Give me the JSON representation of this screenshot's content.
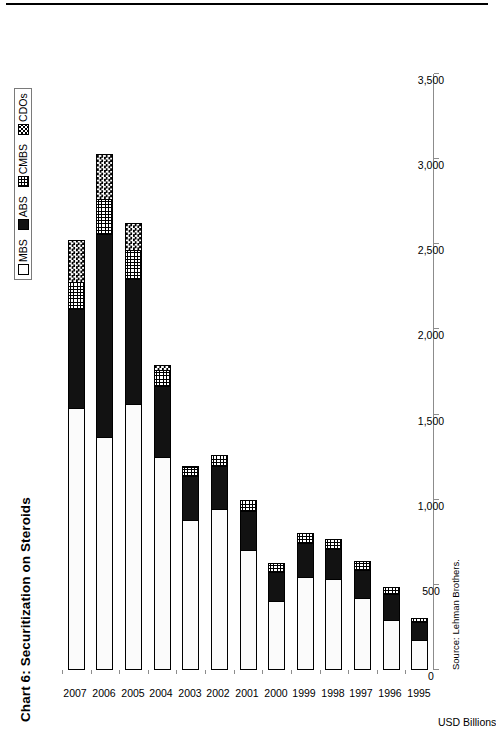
{
  "chart_data": {
    "type": "bar",
    "orientation": "horizontal-stacked",
    "title": "Chart 6: Securitization on Steroids",
    "xlabel": "USD Billions",
    "ylabel": "",
    "source": "Source: Lehman Brothers.",
    "grid": false,
    "legend_position": "top-right",
    "value_axis_label": "USD Billions",
    "value_ticks": [
      "0",
      "500",
      "1,000",
      "1,500",
      "2,000",
      "2,500",
      "3,000",
      "3,500"
    ],
    "value_tick_numbers": [
      0,
      500,
      1000,
      1500,
      2000,
      2500,
      3000,
      3500
    ],
    "xlim": [
      0,
      3500
    ],
    "categories": [
      "1995",
      "1996",
      "1997",
      "1998",
      "1999",
      "2000",
      "2001",
      "2002",
      "2003",
      "2004",
      "2005",
      "2006",
      "2007"
    ],
    "series": [
      {
        "name": "MBS",
        "values": [
          170,
          290,
          420,
          530,
          545,
          400,
          700,
          940,
          880,
          1250,
          1560,
          1360,
          1535
        ]
      },
      {
        "name": "ABS",
        "values": [
          110,
          155,
          165,
          180,
          200,
          175,
          230,
          260,
          260,
          420,
          735,
          1200,
          585
        ]
      },
      {
        "name": "CMBS",
        "values": [
          25,
          40,
          55,
          60,
          60,
          55,
          70,
          65,
          55,
          90,
          170,
          205,
          155
        ]
      },
      {
        "name": "CDOs",
        "values": [
          0,
          0,
          0,
          0,
          0,
          0,
          0,
          0,
          5,
          30,
          160,
          265,
          250
        ]
      }
    ],
    "totals": [
      305,
      485,
      640,
      770,
      805,
      630,
      1000,
      1265,
      1200,
      1790,
      2625,
      3030,
      2525
    ]
  },
  "legend": {
    "items": [
      {
        "label": "MBS",
        "swatch": "open-square-swatch"
      },
      {
        "label": "ABS",
        "swatch": "solid-black-swatch"
      },
      {
        "label": "CMBS",
        "swatch": "grid-pattern-swatch"
      },
      {
        "label": "CDOs",
        "swatch": "checker-pattern-swatch"
      }
    ]
  },
  "colors": {
    "mbs": "#ffffff",
    "abs": "#121212",
    "cmbs": "#ffffff",
    "cdos": "#ffffff",
    "outline": "#000000",
    "axis": "#8c8c8c"
  }
}
